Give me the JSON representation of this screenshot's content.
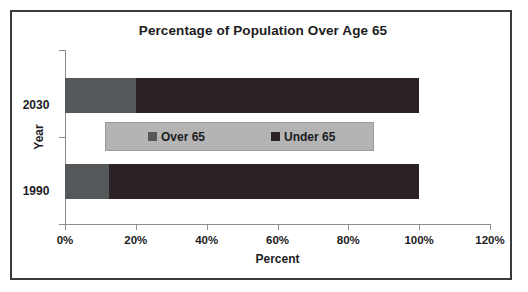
{
  "chart": {
    "title": "Percentage of Population Over Age 65",
    "xlabel": "Percent",
    "ylabel": "Year"
  },
  "axis": {
    "x_ticks": [
      "0%",
      "20%",
      "40%",
      "60%",
      "80%",
      "100%",
      "120%"
    ],
    "y_categories": [
      "2030",
      "1990"
    ]
  },
  "legend": {
    "items": [
      {
        "label": "Over 65",
        "color": "#55585a"
      },
      {
        "label": "Under 65",
        "color": "#2a2224"
      }
    ]
  },
  "colors": {
    "over65": "#55585a",
    "under65": "#2a2224",
    "legend_background": "#b4b4b4",
    "axis": "#8d8d90",
    "frame": "#3a3a3c",
    "text": "#1c1c1e",
    "plot_background": "#ffffff"
  },
  "chart_data": {
    "type": "bar",
    "orientation": "horizontal",
    "stacked": true,
    "title": "Percentage of Population Over Age 65",
    "xlabel": "Percent",
    "ylabel": "Year",
    "categories": [
      "2030",
      "1990"
    ],
    "series": [
      {
        "name": "Over 65",
        "values": [
          20,
          12.3
        ]
      },
      {
        "name": "Under 65",
        "values": [
          80,
          87.7
        ]
      }
    ],
    "xlim": [
      0,
      120
    ],
    "xtick_values": [
      0,
      20,
      40,
      60,
      80,
      100,
      120
    ],
    "xtick_labels": [
      "0%",
      "20%",
      "40%",
      "60%",
      "80%",
      "100%",
      "120%"
    ],
    "grid": false,
    "legend_position": "center"
  }
}
